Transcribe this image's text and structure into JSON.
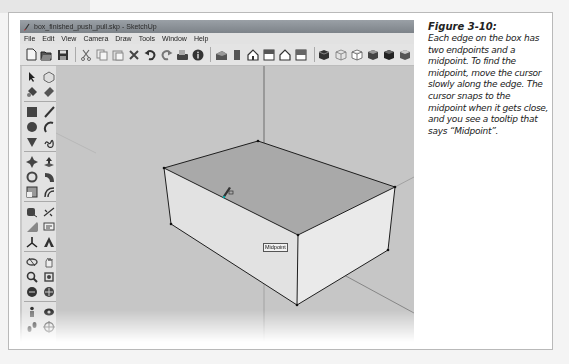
{
  "window": {
    "title": "box_finished_push_pull.skp - SketchUp",
    "menu": [
      "File",
      "Edit",
      "View",
      "Camera",
      "Draw",
      "Tools",
      "Window",
      "Help"
    ],
    "toolbar_icons": [
      [
        "new-icon",
        "open-icon",
        "save-icon"
      ],
      [
        "cut-icon",
        "copy-icon",
        "paste-icon",
        "erase-icon",
        "undo-icon",
        "redo-icon",
        "print-icon",
        "model-info-icon"
      ],
      [
        "iso-view-icon",
        "front-view-icon",
        "home-view-icon",
        "top-view-icon",
        "house-view-icon",
        "bottom-view-icon"
      ],
      [
        "xray-style-icon",
        "wireframe-style-icon",
        "hidden-line-style-icon",
        "shaded-style-icon",
        "shaded-texture-style-icon",
        "monochrome-style-icon"
      ]
    ],
    "sidebar_icons": [
      [
        "select-icon",
        "make-component-icon",
        "paint-bucket-icon",
        "eraser-icon"
      ],
      [
        "rectangle-icon",
        "line-icon",
        "circle-icon",
        "arc-icon",
        "polygon-icon",
        "freehand-icon"
      ],
      [
        "move-icon",
        "push-pull-icon",
        "rotate-icon",
        "follow-me-icon",
        "scale-icon",
        "offset-icon"
      ],
      [
        "tape-measure-icon",
        "dimension-icon",
        "protractor-icon",
        "text-icon",
        "axes-icon",
        "3d-text-icon"
      ],
      [
        "orbit-icon",
        "pan-icon",
        "zoom-icon",
        "zoom-window-icon",
        "previous-view-icon",
        "zoom-extents-icon"
      ],
      [
        "position-camera-icon",
        "look-around-icon",
        "walk-icon",
        "section-plane-icon"
      ]
    ],
    "tooltip": "Midpoint"
  },
  "caption": {
    "figure_label": "Figure 3-10:",
    "text": "Each edge on the box has two endpoints and a midpoint. To find the midpoint, move the cursor slowly along the edge. The cursor snaps to the midpoint when it gets close, and you see a tooltip that says “Midpoint”."
  }
}
